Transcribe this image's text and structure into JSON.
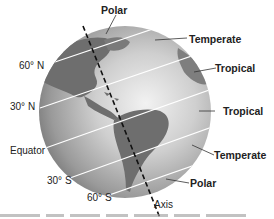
{
  "diagram": {
    "zones": {
      "top_polar": "Polar",
      "north_temperate": "Temperate",
      "north_tropical": "Tropical",
      "equator_tropical": "Tropical",
      "south_temperate": "Temperate",
      "bottom_polar": "Polar"
    },
    "latitudes": {
      "n60": "60° N",
      "n30": "30° N",
      "equator": "Equator",
      "s30": "30° S",
      "s60": "60° S"
    },
    "axis_label": "Axis",
    "colors": {
      "ocean": "#b8b8b8",
      "land": "#6e6e6e",
      "latitude_line": "#ffffff",
      "axis_line": "#111111",
      "text": "#222222"
    }
  }
}
